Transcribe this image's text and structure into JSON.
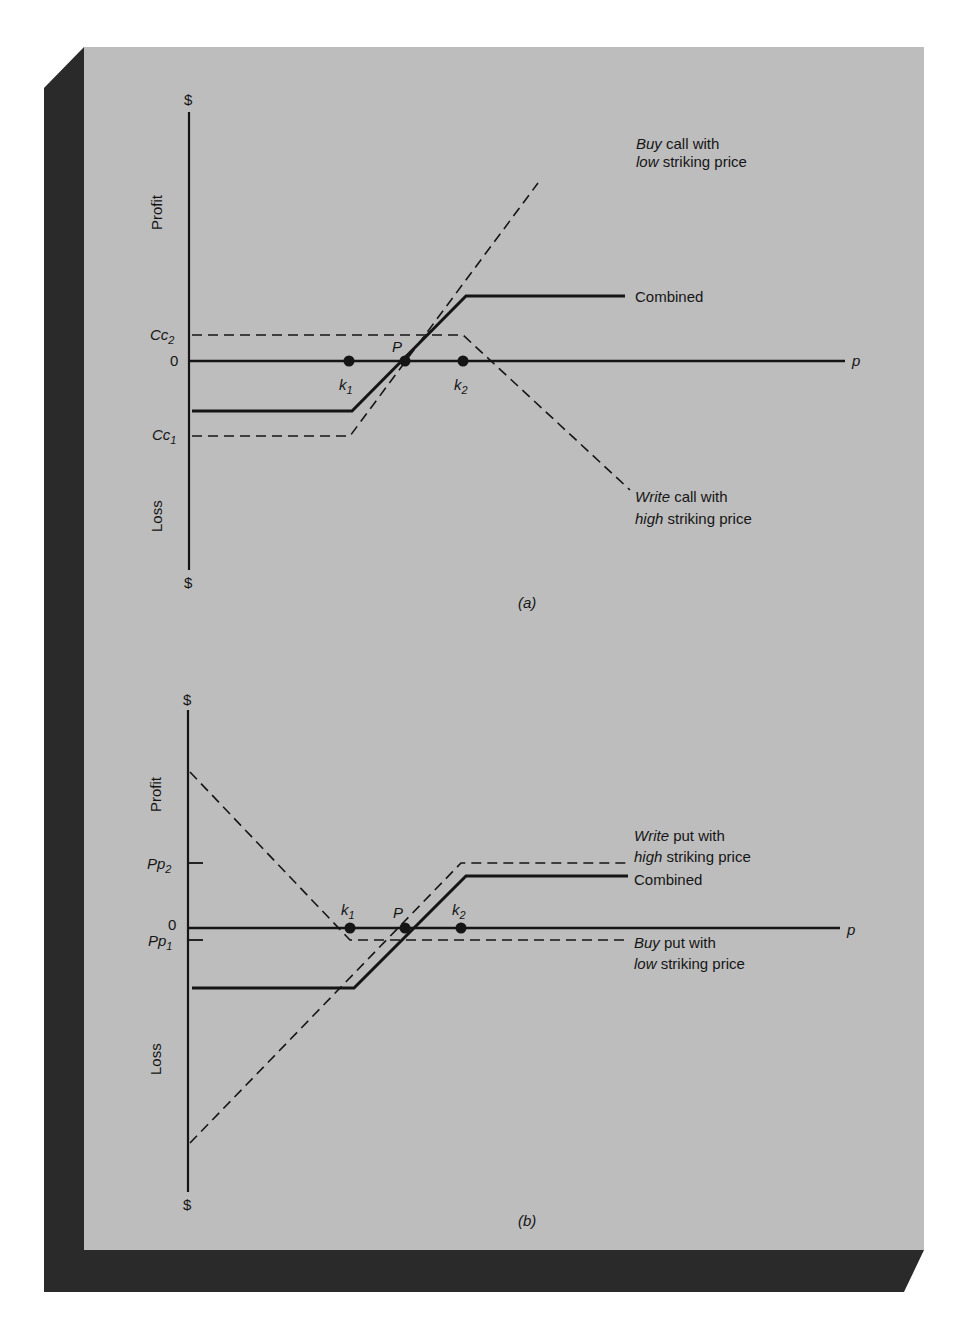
{
  "colors": {
    "page_bg": "#ffffff",
    "panel_bg": "#bdbdbd",
    "panel_shadow": "#2a2a2a",
    "ink": "#151515"
  },
  "panels": [
    {
      "id": "a",
      "caption": "(a)",
      "y_axis": {
        "top_label": "$",
        "bottom_label": "$",
        "upper_label": "Profit",
        "lower_label": "Loss"
      },
      "x_axis": {
        "label": "p"
      },
      "tick_labels": [
        {
          "main": "Cc",
          "sub": "2",
          "level": "Cc2"
        },
        {
          "main": "0",
          "sub": "",
          "level": "zero"
        },
        {
          "main": "Cc",
          "sub": "1",
          "level": "Cc1"
        }
      ],
      "points": [
        {
          "main": "k",
          "sub": "1",
          "position": "below"
        },
        {
          "main": "P",
          "sub": "",
          "position": "above"
        },
        {
          "main": "k",
          "sub": "2",
          "position": "below"
        }
      ],
      "curves": [
        {
          "name": "Buy call with low striking price",
          "style": "dashed",
          "label_line1_italic": "Buy",
          "label_line1_rest": " call with",
          "label_line2_italic": "low",
          "label_line2_rest": " striking price"
        },
        {
          "name": "Combined",
          "style": "solid",
          "label": "Combined"
        },
        {
          "name": "Write call with high striking price",
          "style": "dashed",
          "label_line1_italic": "Write",
          "label_line1_rest": " call with",
          "label_line2_italic": "high",
          "label_line2_rest": " striking price"
        }
      ]
    },
    {
      "id": "b",
      "caption": "(b)",
      "y_axis": {
        "top_label": "$",
        "bottom_label": "$",
        "upper_label": "Profit",
        "lower_label": "Loss"
      },
      "x_axis": {
        "label": "p"
      },
      "tick_labels": [
        {
          "main": "Pp",
          "sub": "2",
          "level": "Pp2"
        },
        {
          "main": "0",
          "sub": "",
          "level": "zero"
        },
        {
          "main": "Pp",
          "sub": "1",
          "level": "Pp1"
        }
      ],
      "points": [
        {
          "main": "k",
          "sub": "1",
          "position": "above"
        },
        {
          "main": "P",
          "sub": "",
          "position": "above"
        },
        {
          "main": "k",
          "sub": "2",
          "position": "above"
        }
      ],
      "curves": [
        {
          "name": "Write put with high striking price",
          "style": "dashed",
          "label_line1_italic": "Write",
          "label_line1_rest": " put with",
          "label_line2_italic": "high",
          "label_line2_rest": " striking price"
        },
        {
          "name": "Combined",
          "style": "solid",
          "label": "Combined"
        },
        {
          "name": "Buy put with low striking price",
          "style": "dashed",
          "label_line1_italic": "Buy",
          "label_line1_rest": " put with",
          "label_line2_italic": "low",
          "label_line2_rest": " striking price"
        }
      ]
    }
  ]
}
